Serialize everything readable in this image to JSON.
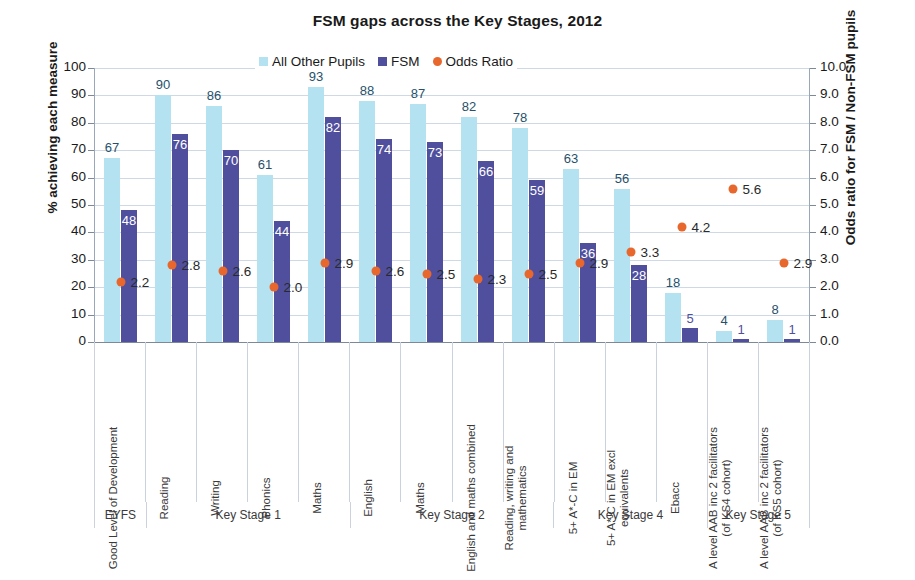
{
  "chart_data": {
    "type": "bar",
    "title": "FSM gaps across the Key Stages, 2012",
    "xlabel": "",
    "ylabel": "% achieving each measure",
    "y2label": "Odds ratio for FSM / Non-FSM pupils",
    "ylim": [
      0,
      100
    ],
    "y2lim": [
      0.0,
      10.0
    ],
    "yticks": [
      "0",
      "10",
      "20",
      "30",
      "40",
      "50",
      "60",
      "70",
      "80",
      "90",
      "100"
    ],
    "y2ticks": [
      "0.0",
      "1.0",
      "2.0",
      "3.0",
      "4.0",
      "5.0",
      "6.0",
      "7.0",
      "8.0",
      "9.0",
      "10.0"
    ],
    "grid": true,
    "legend_position": "top-center",
    "legend": [
      {
        "label": "All Other Pupils",
        "color": "#b4e2f0",
        "marker": "square"
      },
      {
        "label": "FSM",
        "color": "#4f4f9e",
        "marker": "square"
      },
      {
        "label": "Odds Ratio",
        "color": "#e8672c",
        "marker": "circle"
      }
    ],
    "categories": [
      "Good Level of Development",
      "Reading",
      "Writing",
      "Phonics",
      "Maths",
      "English",
      "Maths",
      "English and maths combined",
      "Reading, writing and mathematics",
      "5+ A*-C in EM",
      "5+ A*-C in EM excl equivalents",
      "Ebacc",
      "A level AAB inc 2 facilitators (of KS4 cohort)",
      "A level AAB inc 2 facilitators (of KS5 cohort)"
    ],
    "series": [
      {
        "name": "All Other Pupils",
        "axis": "left",
        "color": "#b4e2f0",
        "values": [
          67,
          90,
          86,
          61,
          93,
          88,
          87,
          82,
          78,
          63,
          56,
          18,
          4,
          8
        ]
      },
      {
        "name": "FSM",
        "axis": "left",
        "color": "#4f4f9e",
        "values": [
          48,
          76,
          70,
          44,
          82,
          74,
          73,
          66,
          59,
          36,
          28,
          5,
          1,
          1
        ]
      },
      {
        "name": "Odds Ratio",
        "axis": "right",
        "color": "#e8672c",
        "marker": "circle",
        "values": [
          2.2,
          2.8,
          2.6,
          2.0,
          2.9,
          2.6,
          2.5,
          2.3,
          2.5,
          2.9,
          3.3,
          4.2,
          5.6,
          2.9
        ]
      }
    ],
    "key_stages": [
      {
        "label": "EYFS",
        "span": 1
      },
      {
        "label": "Key Stage 1",
        "span": 4
      },
      {
        "label": "Key Stage 2",
        "span": 4
      },
      {
        "label": "Key Stage 4",
        "span": 3
      },
      {
        "label": "Key Stage 5",
        "span": 2
      }
    ]
  }
}
